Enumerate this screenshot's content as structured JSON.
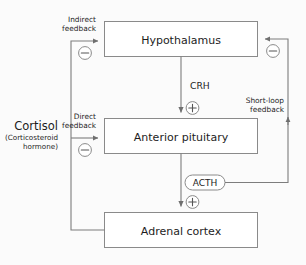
{
  "diagram": {
    "background_color": "#fbfbfb",
    "line_color": "#7d7d7d",
    "box_border_color": "#8a8a8a",
    "box_fill_color": "#ffffff",
    "text_color": "#1d1d1d",
    "nodes": [
      {
        "id": "hypothalamus",
        "label": "Hypothalamus"
      },
      {
        "id": "anterior-pituitary",
        "label": "Anterior pituitary"
      },
      {
        "id": "adrenal-cortex",
        "label": "Adrenal cortex"
      }
    ],
    "hormones": {
      "cortisol": {
        "name": "Cortisol",
        "subtitle_line1": "(Corticosteroid",
        "subtitle_line2": "hormone)"
      },
      "crh": {
        "label": "CRH"
      },
      "acth": {
        "label": "ACTH"
      }
    },
    "feedback_labels": {
      "indirect_line1": "Indirect",
      "indirect_line2": "feedback",
      "direct_line1": "Direct",
      "direct_line2": "feedback",
      "short_loop_line1": "Short-loop",
      "short_loop_line2": "feedback"
    },
    "signs": {
      "minus": "−",
      "plus": "+"
    },
    "edges": [
      {
        "id": "crh-edge",
        "from": "hypothalamus",
        "to": "anterior-pituitary",
        "label": "CRH",
        "sign": "+"
      },
      {
        "id": "acth-edge",
        "from": "anterior-pituitary",
        "to": "adrenal-cortex",
        "label": "ACTH",
        "sign": "+"
      },
      {
        "id": "indirect-feedback-edge",
        "from": "adrenal-cortex",
        "to": "hypothalamus",
        "label": "Indirect feedback",
        "sign": "−"
      },
      {
        "id": "direct-feedback-edge",
        "from": "adrenal-cortex",
        "to": "anterior-pituitary",
        "label": "Direct feedback",
        "sign": "−"
      },
      {
        "id": "short-loop-feedback-edge",
        "from": "acth",
        "to": "hypothalamus",
        "label": "Short-loop feedback",
        "sign": "−"
      }
    ]
  }
}
